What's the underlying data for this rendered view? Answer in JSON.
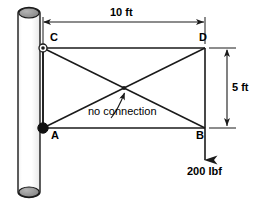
{
  "figure": {
    "type": "engineering-truss-free-body-diagram",
    "background_color": "#ffffff",
    "line_color": "#1a1a1a",
    "pole_fill_color": "#fefefe",
    "pole_cap_color": "#8a8a8a"
  },
  "labels": {
    "point_a": "A",
    "point_b": "B",
    "point_c": "C",
    "point_d": "D"
  },
  "dimensions": {
    "span_label": "10 ft",
    "height_label": "5 ft"
  },
  "annotations": {
    "no_connection": "no connection"
  },
  "load": {
    "magnitude_label": "200 lbf"
  },
  "geometry": {
    "pole_left_x": 18,
    "pole_right_x": 40,
    "pole_top_y": 8,
    "pole_bottom_y": 197,
    "node_a": {
      "x": 43,
      "y": 128
    },
    "node_b": {
      "x": 205,
      "y": 128
    },
    "node_c": {
      "x": 43,
      "y": 48
    },
    "node_d": {
      "x": 205,
      "y": 48
    },
    "crossing": {
      "x": 124,
      "y": 88
    },
    "span_dim_y": 22,
    "height_dim_x": 227,
    "load_arrow_tip_y": 163
  }
}
